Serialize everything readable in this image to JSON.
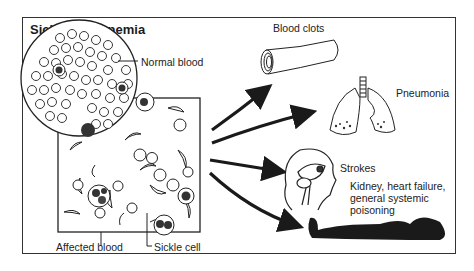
{
  "diagram": {
    "title": "Sickle Cell Anemia",
    "labels": {
      "normal_blood": "Normal blood",
      "affected_blood": "Affected blood",
      "sickle_cell": "Sickle cell"
    },
    "complications": [
      {
        "id": "blood-clots",
        "label": "Blood clots",
        "icon": "blood-vessel-icon"
      },
      {
        "id": "pneumonia",
        "label": "Pneumonia",
        "icon": "lungs-icon"
      },
      {
        "id": "strokes",
        "label": "Strokes",
        "icon": "head-brain-icon"
      },
      {
        "id": "organ-failure",
        "label": "Kidney, heart failure, general systemic poisoning",
        "icon": "reclining-body-icon"
      }
    ],
    "colors": {
      "ink": "#1a1a1a",
      "line": "#333333",
      "background": "#ffffff"
    }
  }
}
